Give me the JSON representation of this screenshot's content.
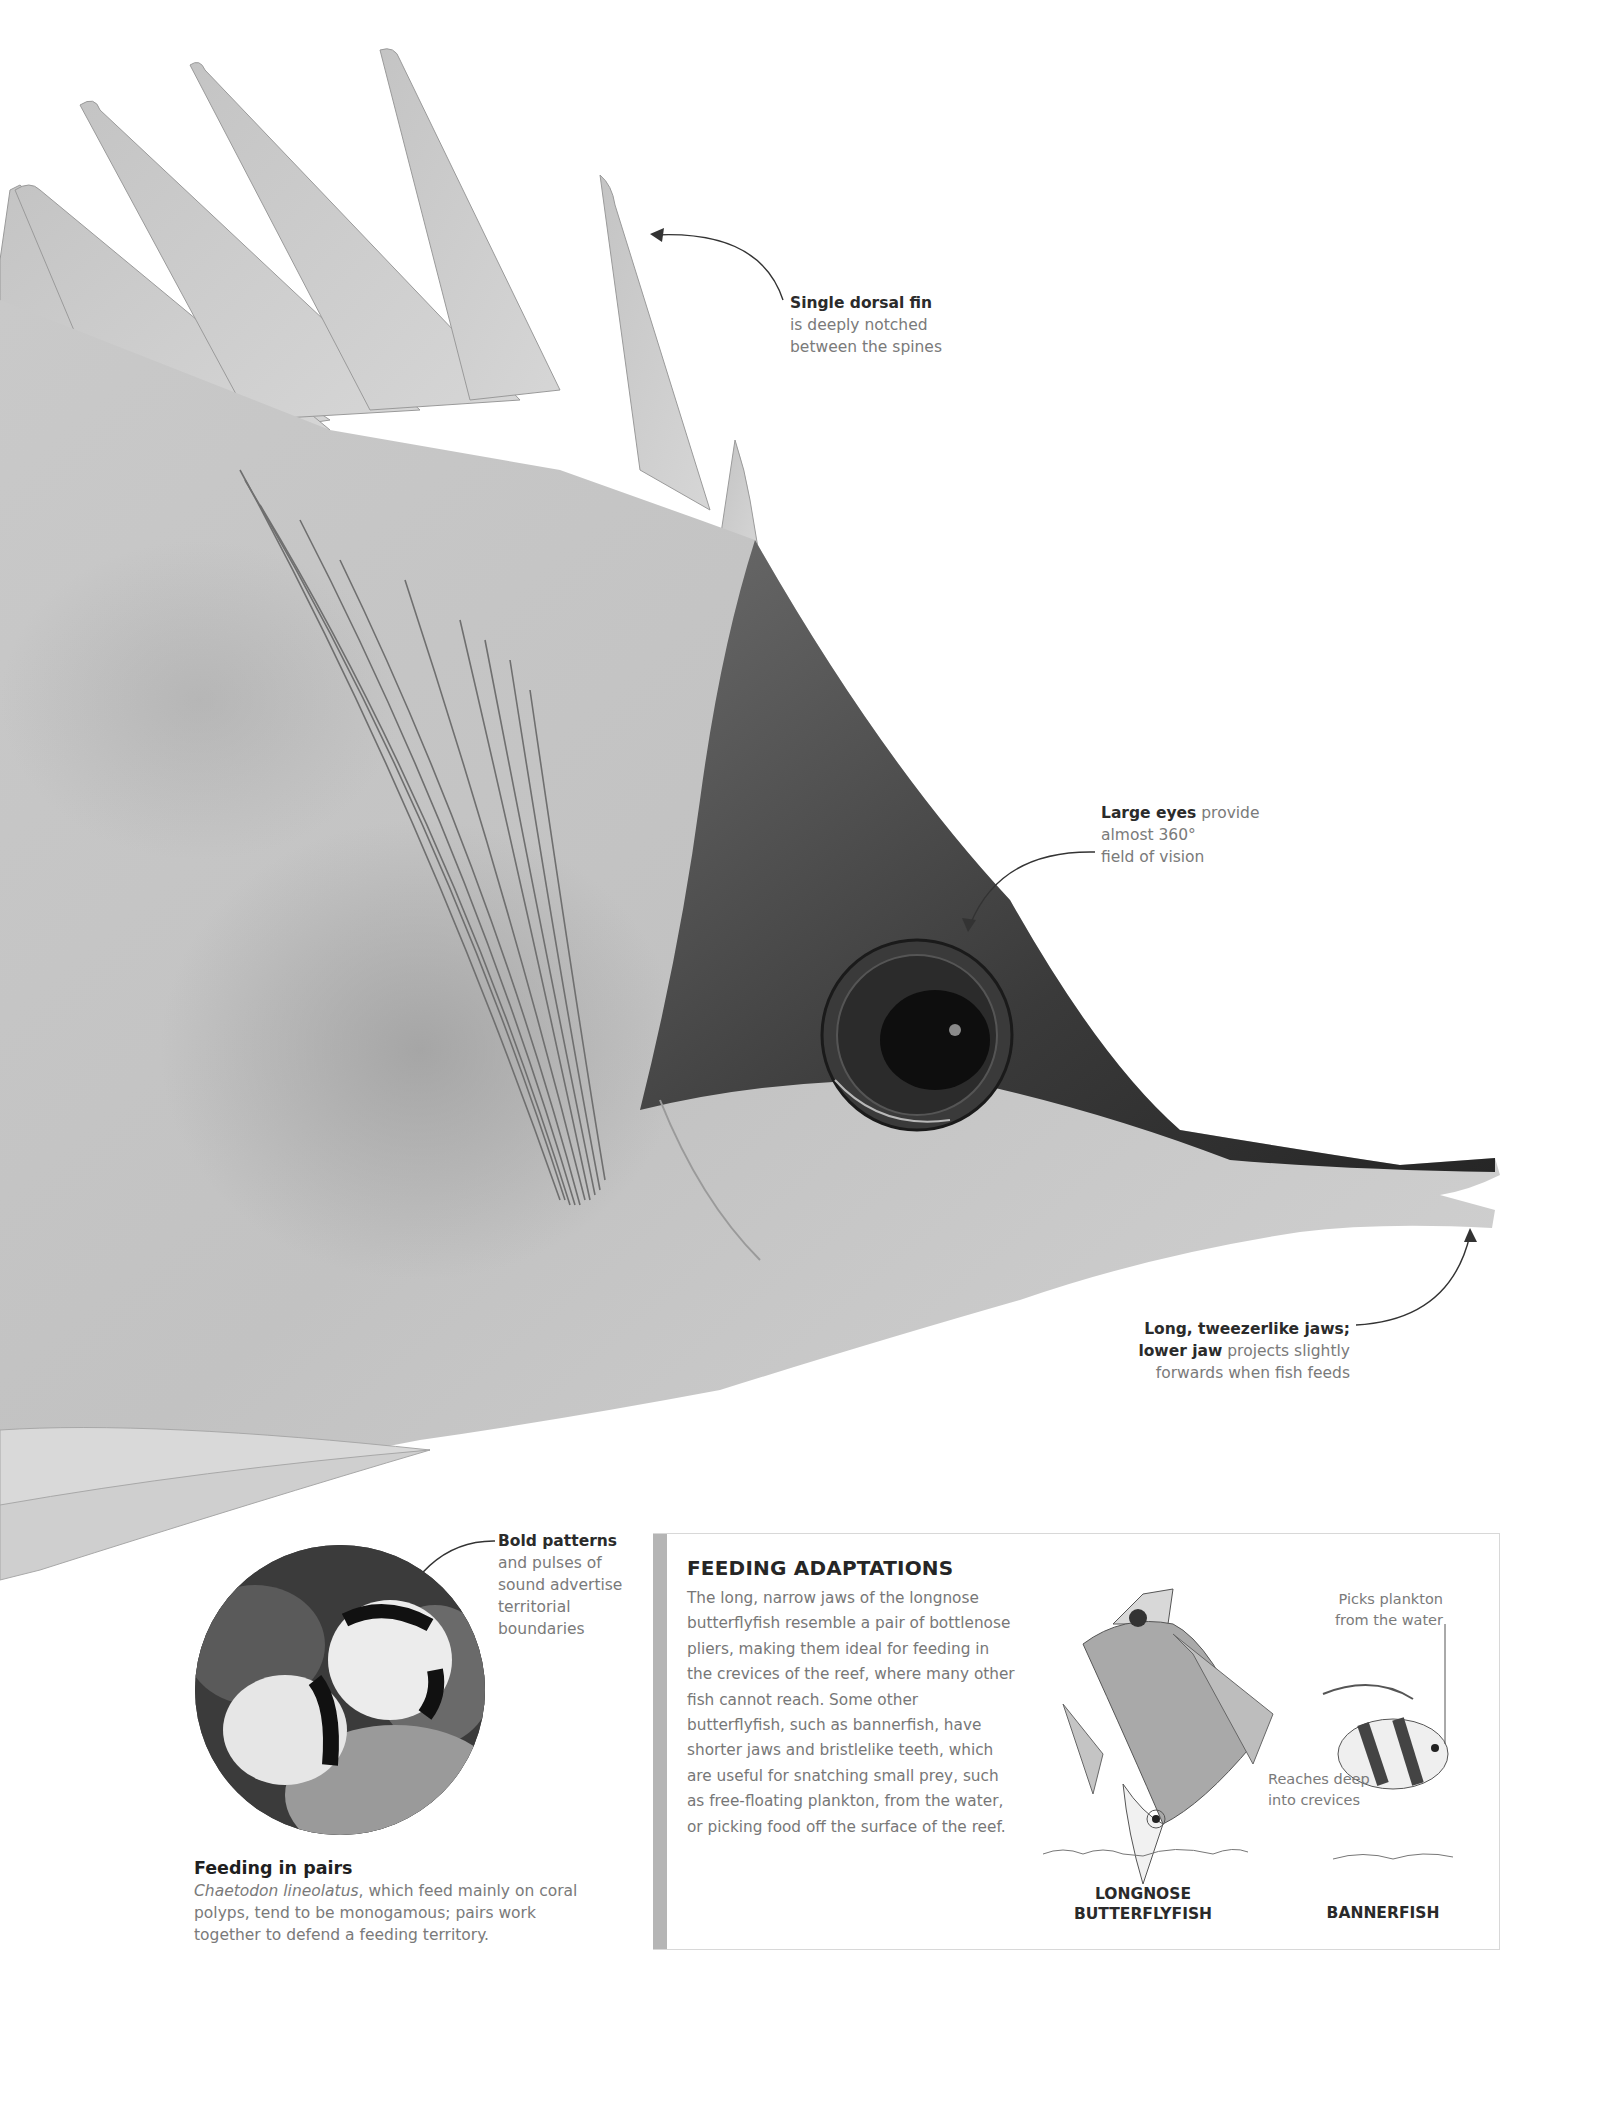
{
  "main_illustration": {
    "subject": "longnose butterflyfish head (photograph)",
    "callouts": [
      {
        "id": "dorsal",
        "bold": "Single dorsal fin",
        "text": "is deeply notched between the spines",
        "lines": [
          "Single dorsal fin",
          "is deeply notched",
          "between the spines"
        ]
      },
      {
        "id": "eyes",
        "bold": "Large eyes",
        "text": "provide almost 360° field of vision",
        "lines": [
          "Large eyes provide",
          "almost 360°",
          "field of vision"
        ]
      },
      {
        "id": "jaws",
        "bold": "Long, tweezerlike jaws;",
        "bold2": "lower jaw",
        "text": "projects slightly forwards when fish feeds",
        "lines": [
          "Long, tweezerlike jaws;",
          "lower jaw projects slightly",
          "forwards when fish feeds"
        ]
      }
    ]
  },
  "inset_photo": {
    "callout": {
      "bold": "Bold patterns",
      "lines": [
        "and pulses of",
        "sound advertise",
        "territorial",
        "boundaries"
      ]
    },
    "caption": {
      "title": "Feeding in pairs",
      "species": "Chaetodon lineolatus",
      "text": ", which feed mainly on coral polyps, tend to be monogamous; pairs work together to defend a feeding territory."
    }
  },
  "feeding_box": {
    "heading": "FEEDING ADAPTATIONS",
    "body": "The long, narrow jaws of the longnose butterflyfish resemble a pair of bottlenose pliers, making them ideal for feeding in the crevices of the reef, where many other fish cannot reach. Some other butterflyfish, such as bannerfish, have shorter jaws and bristlelike teeth, which are useful for snatching small prey, such as free-floating plankton, from the water, or picking food off the surface of the reef.",
    "diagrams": [
      {
        "label_line1": "LONGNOSE",
        "label_line2": "BUTTERFLYFISH",
        "note_line1": "Reaches deep",
        "note_line2": "into crevices"
      },
      {
        "label_line1": "BANNERFISH",
        "note_line1": "Picks plankton",
        "note_line2": "from the water"
      }
    ],
    "colors": {
      "bar": "#b5b5b5",
      "border": "#d8d8d8"
    }
  }
}
